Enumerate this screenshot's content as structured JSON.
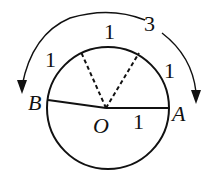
{
  "diagram": {
    "circle": {
      "cx": 108,
      "cy": 108,
      "r": 61
    },
    "points": {
      "A": {
        "label": "A",
        "x": 169,
        "y": 108
      },
      "B": {
        "label": "B",
        "x": 48,
        "y": 100
      },
      "O": {
        "label": "O",
        "x": 106,
        "y": 108
      }
    },
    "labels": {
      "radius_OA": "1",
      "arc_left": "1",
      "arc_top": "1",
      "arc_right": "1",
      "total_arc": "3"
    },
    "colors": {
      "stroke": "#111111",
      "background": "#ffffff"
    }
  }
}
